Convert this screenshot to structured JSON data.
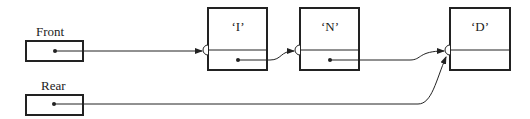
{
  "diagram": {
    "type": "linked-queue",
    "pointers": [
      {
        "label": "Front",
        "points_to": "I"
      },
      {
        "label": "Rear",
        "points_to": "D"
      }
    ],
    "nodes": [
      {
        "value": "‘I’",
        "next": "N"
      },
      {
        "value": "‘N’",
        "next": "D"
      },
      {
        "value": "‘D’",
        "next": null
      }
    ]
  },
  "colors": {
    "ink": "#222222",
    "background": "#ffffff"
  }
}
